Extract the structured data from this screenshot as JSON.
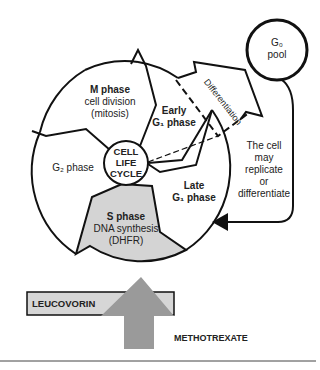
{
  "diagram": {
    "center_label": [
      "CELL",
      "LIFE",
      "CYCLE"
    ],
    "phases": [
      {
        "id": "m",
        "title": "M phase",
        "lines": [
          "cell division",
          "(mitosis)"
        ]
      },
      {
        "id": "early-g1",
        "title_lines": [
          "Early",
          "G₁ phase"
        ]
      },
      {
        "id": "late-g1",
        "title_lines": [
          "Late",
          "G₁ phase"
        ]
      },
      {
        "id": "s",
        "title": "S phase",
        "lines": [
          "DNA synthesis",
          "(DHFR)"
        ],
        "fill": "#d4d4d4"
      },
      {
        "id": "g2",
        "label": "G₂ phase"
      }
    ],
    "g0": {
      "lines": [
        "G₀",
        "pool"
      ]
    },
    "differentiation_label": "Differentiation",
    "side_note": [
      "The cell",
      "may",
      "replicate",
      "or",
      "differentiate"
    ],
    "drugs": {
      "leucovorin": "LEUCOVORIN",
      "methotrexate": "METHOTREXATE",
      "leucovorin_fill": "#d6d6d6",
      "arrow_fill": "#9a9a9a"
    }
  }
}
